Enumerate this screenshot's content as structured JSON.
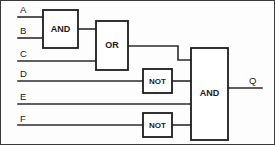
{
  "diagram": {
    "type": "digital-logic-schematic",
    "output_expression": "Q = ((A AND B) OR C) AND (NOT D) AND E AND (NOT F)",
    "colors": {
      "background": "#fdfdfd",
      "wire": "#2a2a2a",
      "gate_stroke": "#1c1c1c",
      "gate_fill": "#ffffff",
      "frame": "#3a3a3a",
      "text": "#1a1a1a"
    }
  },
  "inputs": [
    {
      "id": "A",
      "label": "A",
      "label_x": 20,
      "label_y": 13,
      "wire_y": 17,
      "wire_x1": 18,
      "wire_x2": 43
    },
    {
      "id": "B",
      "label": "B",
      "label_x": 20,
      "label_y": 34,
      "wire_y": 38,
      "wire_x1": 18,
      "wire_x2": 43
    },
    {
      "id": "C",
      "label": "C",
      "label_x": 20,
      "label_y": 57,
      "wire_y": 61,
      "wire_x1": 18,
      "wire_x2": 96
    },
    {
      "id": "D",
      "label": "D",
      "label_x": 20,
      "label_y": 77,
      "wire_y": 81,
      "wire_x1": 18,
      "wire_x2": 143
    },
    {
      "id": "E",
      "label": "E",
      "label_x": 20,
      "label_y": 100,
      "wire_y": 104,
      "wire_x1": 18,
      "wire_x2": 191
    },
    {
      "id": "F",
      "label": "F",
      "label_x": 20,
      "label_y": 122,
      "wire_y": 125,
      "wire_x1": 18,
      "wire_x2": 143
    }
  ],
  "output": {
    "id": "Q",
    "label": "Q",
    "label_x": 249,
    "label_y": 84,
    "wire_y": 88,
    "wire_x1": 228,
    "wire_x2": 262
  },
  "gates": [
    {
      "id": "and1",
      "type": "AND",
      "label": "AND",
      "x": 43,
      "y": 10,
      "width": 35,
      "height": 38,
      "label_x": 60.5,
      "label_y": 30,
      "inputs": [
        "A",
        "B"
      ],
      "output_to": "or1"
    },
    {
      "id": "or1",
      "type": "OR",
      "label": "OR",
      "x": 96,
      "y": 21,
      "width": 32,
      "height": 49,
      "label_x": 112,
      "label_y": 46,
      "inputs": [
        "and1",
        "C"
      ],
      "output_to": "and_out"
    },
    {
      "id": "not1",
      "type": "NOT",
      "label": "NOT",
      "x": 143,
      "y": 69,
      "width": 29,
      "height": 24,
      "label_x": 157.5,
      "label_y": 81,
      "inputs": [
        "D"
      ],
      "output_to": "and_out"
    },
    {
      "id": "not2",
      "type": "NOT",
      "label": "NOT",
      "x": 143,
      "y": 113,
      "width": 29,
      "height": 24,
      "label_x": 157.5,
      "label_y": 125,
      "inputs": [
        "F"
      ],
      "output_to": "and_out"
    },
    {
      "id": "and_out",
      "type": "AND",
      "label": "AND",
      "x": 191,
      "y": 48,
      "width": 37,
      "height": 92,
      "label_x": 209.5,
      "label_y": 94,
      "inputs": [
        "or1",
        "not1",
        "E",
        "not2"
      ],
      "output_to": "Q"
    }
  ],
  "wires": [
    {
      "id": "wire-a-to-and1",
      "from": "A",
      "to": "and1",
      "path": "M18,17 L43,17"
    },
    {
      "id": "wire-b-to-and1",
      "from": "B",
      "to": "and1",
      "path": "M18,38 L43,38"
    },
    {
      "id": "wire-and1-to-or1",
      "from": "and1",
      "to": "or1",
      "path": "M78,29 L96,29"
    },
    {
      "id": "wire-c-to-or1",
      "from": "C",
      "to": "or1",
      "path": "M18,61 L96,61"
    },
    {
      "id": "wire-or1-to-and",
      "from": "or1",
      "to": "and_out",
      "path": "M128,46 L178,46 L178,60 L191,60"
    },
    {
      "id": "wire-d-to-not1",
      "from": "D",
      "to": "not1",
      "path": "M18,81 L143,81"
    },
    {
      "id": "wire-not1-to-and",
      "from": "not1",
      "to": "and_out",
      "path": "M172,81 L191,81"
    },
    {
      "id": "wire-e-to-and",
      "from": "E",
      "to": "and_out",
      "path": "M18,104 L191,104"
    },
    {
      "id": "wire-f-to-not2",
      "from": "F",
      "to": "not2",
      "path": "M18,125 L143,125"
    },
    {
      "id": "wire-not2-to-and",
      "from": "not2",
      "to": "and_out",
      "path": "M172,125 L191,125"
    },
    {
      "id": "wire-and-to-q",
      "from": "and_out",
      "to": "Q",
      "path": "M228,88 L262,88"
    }
  ],
  "frame": {
    "x": 0.5,
    "y": 0.5,
    "width": 274,
    "height": 144
  }
}
